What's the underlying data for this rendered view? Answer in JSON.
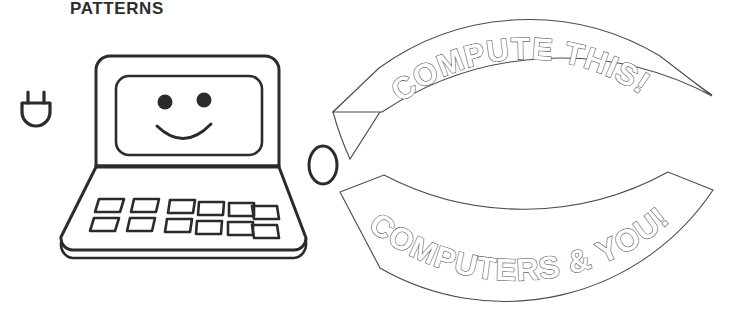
{
  "page": {
    "title": "PATTERNS",
    "background_color": "#ffffff",
    "ink_color": "#2b2b2b",
    "outline_color": "#4a4a4a"
  },
  "artwork": {
    "type": "coloring-page-line-art",
    "plug": {
      "icon": "power-plug-icon",
      "prong_count": 2
    },
    "laptop": {
      "icon": "laptop-icon",
      "screen_face": "smiley-face",
      "eye_count": 2,
      "mouth": "smile-curve",
      "keyboard": {
        "rows": 2,
        "columns": 6,
        "key_shape": "parallelogram",
        "key_total": 12
      }
    },
    "mouse": {
      "icon": "computer-mouse-icon",
      "shape": "oval"
    }
  },
  "banners": [
    {
      "id": "banner-top",
      "text": "COMPUTE THIS!",
      "arc": "convex-up",
      "style": "outline-letters",
      "end_shape": "pointed"
    },
    {
      "id": "banner-bottom",
      "text": "COMPUTERS & YOU!",
      "arc": "concave-up",
      "style": "outline-letters",
      "end_shape": "pointed"
    }
  ]
}
